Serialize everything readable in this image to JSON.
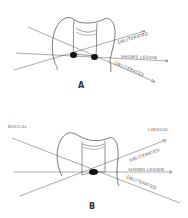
{
  "figure": {
    "panels": [
      {
        "id": "A",
        "label": "A",
        "rays": [
          {
            "label": "OBLITERATED"
          },
          {
            "label": "SHOWS LESION"
          },
          {
            "label": "OBLITERATED"
          }
        ],
        "lesions": 2
      },
      {
        "id": "B",
        "label": "B",
        "left_side_label": "BUCCAL",
        "right_side_label": "LINGUAL",
        "rays": [
          {
            "label": "OBLITERATED"
          },
          {
            "label": "SHOWS LESION"
          },
          {
            "label": "OBLITERATED"
          }
        ],
        "lesions": 1
      }
    ],
    "colors": {
      "line": "#444444",
      "lesion": "#111111",
      "text": "#555555"
    }
  }
}
